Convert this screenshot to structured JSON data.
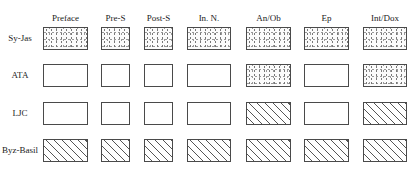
{
  "diagram": {
    "columns": [
      {
        "label": "Preface",
        "x": 43,
        "w": 45
      },
      {
        "label": "Pre-S",
        "x": 101,
        "w": 29
      },
      {
        "label": "Post-S",
        "x": 144,
        "w": 29
      },
      {
        "label": "In. N.",
        "x": 187,
        "w": 44
      },
      {
        "label": "An/Ob",
        "x": 246,
        "w": 45
      },
      {
        "label": "Ep",
        "x": 304,
        "w": 45
      },
      {
        "label": "Int/Dox",
        "x": 363,
        "w": 44
      }
    ],
    "rows": [
      {
        "label": "Sy-Jas",
        "y": 27,
        "cells": [
          "dotted",
          "dotted",
          "dotted",
          "dotted",
          "dotted",
          "dotted",
          "dotted"
        ]
      },
      {
        "label": "ATA",
        "y": 64,
        "cells": [
          "empty",
          "empty",
          "empty",
          "empty",
          "dotted",
          "empty",
          "dotted"
        ]
      },
      {
        "label": "LJC",
        "y": 102,
        "cells": [
          "empty",
          "empty",
          "empty",
          "empty",
          "hatched",
          "empty",
          "hatched"
        ]
      },
      {
        "label": "Byz-Basil",
        "y": 139,
        "cells": [
          "hatched",
          "hatched",
          "hatched",
          "hatched",
          "hatched",
          "hatched",
          "hatched"
        ]
      }
    ],
    "fill_legend": {
      "dotted": "stippled fill",
      "empty": "blank",
      "hatched": "diagonal hatch"
    },
    "colors": {
      "border": "#4a4a4a",
      "text": "#222222",
      "background": "#ffffff"
    }
  }
}
